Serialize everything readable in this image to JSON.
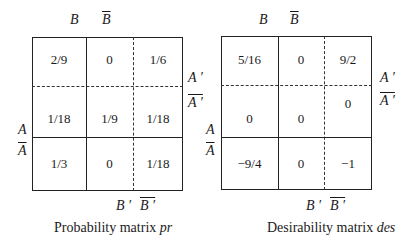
{
  "matrices": [
    {
      "id": "probability",
      "caption_prefix": "Probability matrix ",
      "caption_symbol": "pr",
      "col_labels_top": [
        "B",
        "B"
      ],
      "col_labels_top_overline": [
        false,
        true
      ],
      "col_labels_bottom": [
        "B ′",
        "B ′"
      ],
      "col_labels_bottom_overline": [
        false,
        true
      ],
      "row_labels_left": [
        "A",
        "A"
      ],
      "row_labels_left_overline": [
        false,
        true
      ],
      "row_labels_right": [
        "A ′",
        "A ′"
      ],
      "row_labels_right_overline": [
        false,
        true
      ],
      "cells": [
        [
          "2/9",
          "0",
          "1/6"
        ],
        [
          "1/18",
          "1/9",
          "1/18"
        ],
        [
          "1/3",
          "0",
          "1/18"
        ]
      ]
    },
    {
      "id": "desirability",
      "caption_prefix": "Desirability matrix ",
      "caption_symbol": "des",
      "col_labels_top": [
        "B",
        "B"
      ],
      "col_labels_top_overline": [
        false,
        true
      ],
      "col_labels_bottom": [
        "B ′",
        "B ′"
      ],
      "col_labels_bottom_overline": [
        false,
        true
      ],
      "row_labels_left": [
        "A",
        "A"
      ],
      "row_labels_left_overline": [
        false,
        true
      ],
      "row_labels_right": [
        "A ′",
        "A ′"
      ],
      "row_labels_right_overline": [
        false,
        true
      ],
      "cells": [
        [
          "5/16",
          "0",
          "9/2"
        ],
        [
          "0",
          "0",
          "0"
        ],
        [
          "−9/4",
          "0",
          "−1"
        ]
      ]
    }
  ]
}
